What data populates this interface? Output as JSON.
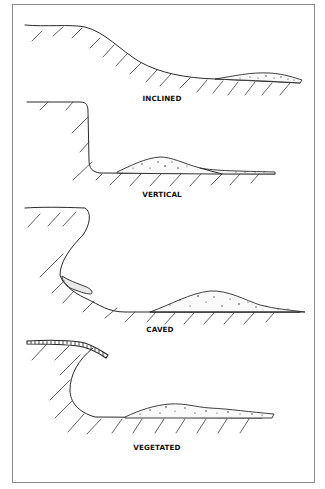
{
  "figure": {
    "panels": [
      {
        "id": "inclined",
        "label": "INCLINED"
      },
      {
        "id": "vertical",
        "label": "VERTICAL"
      },
      {
        "id": "caved",
        "label": "CAVED"
      },
      {
        "id": "vegetated",
        "label": "VEGETATED"
      }
    ]
  },
  "colors": {
    "line": "#2a2a2a",
    "frame": "#8a8a8a",
    "background": "#ffffff"
  }
}
